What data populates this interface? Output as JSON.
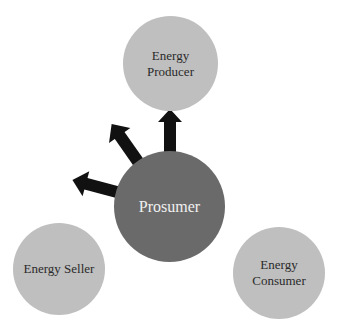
{
  "diagram": {
    "center": {
      "label": "Prosumer",
      "color": "#6a6a6a",
      "text_color": "#f0f0f0"
    },
    "nodes": [
      {
        "id": "producer",
        "line1": "Energy",
        "line2": "Producer",
        "color": "#bfbfbf"
      },
      {
        "id": "seller",
        "line1": "Energy Seller",
        "line2": "",
        "color": "#bfbfbf"
      },
      {
        "id": "consumer",
        "line1": "Energy",
        "line2": "Consumer",
        "color": "#bfbfbf"
      }
    ],
    "arrow_color": "#111111",
    "edges": [
      {
        "from": "Prosumer",
        "to": "Energy Producer"
      },
      {
        "from": "Prosumer",
        "to": "Energy Seller"
      },
      {
        "from": "Prosumer",
        "to": "Energy Consumer"
      }
    ]
  }
}
